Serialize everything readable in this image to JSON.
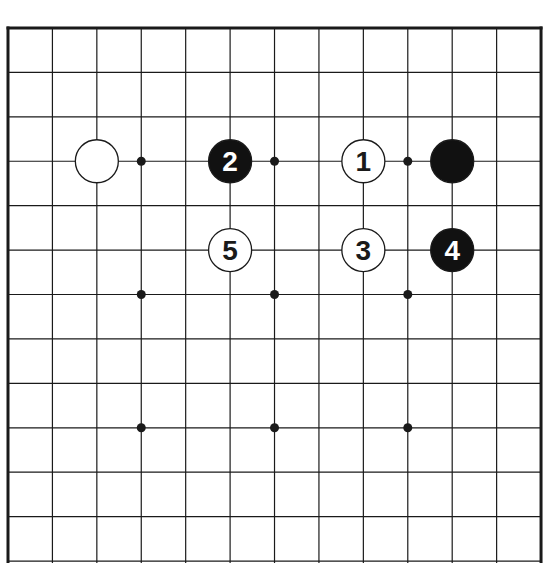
{
  "diagram": {
    "type": "go-board-partial",
    "grid": {
      "origin_x": 8,
      "origin_y": 28,
      "spacing": 44.42,
      "columns": 13,
      "rows_visible": 13,
      "edges": {
        "top": true,
        "left": true,
        "right": true,
        "bottom": false
      }
    },
    "colors": {
      "line": "#1a1a1a",
      "black_stone": "#111111",
      "white_stone": "#ffffff",
      "black_label": "#ffffff",
      "white_label": "#1a1a1a",
      "background": "#ffffff"
    },
    "star_points": [
      {
        "col": 3,
        "row": 3
      },
      {
        "col": 6,
        "row": 3
      },
      {
        "col": 9,
        "row": 3
      },
      {
        "col": 3,
        "row": 6
      },
      {
        "col": 6,
        "row": 6
      },
      {
        "col": 9,
        "row": 6
      },
      {
        "col": 3,
        "row": 9
      },
      {
        "col": 6,
        "row": 9
      },
      {
        "col": 9,
        "row": 9
      }
    ],
    "stones": [
      {
        "color": "white",
        "col": 2,
        "row": 3,
        "label": ""
      },
      {
        "color": "black",
        "col": 5,
        "row": 3,
        "label": "2"
      },
      {
        "color": "white",
        "col": 8,
        "row": 3,
        "label": "1"
      },
      {
        "color": "black",
        "col": 10,
        "row": 3,
        "label": ""
      },
      {
        "color": "white",
        "col": 5,
        "row": 5,
        "label": "5"
      },
      {
        "color": "white",
        "col": 8,
        "row": 5,
        "label": "3"
      },
      {
        "color": "black",
        "col": 10,
        "row": 5,
        "label": "4"
      }
    ]
  }
}
